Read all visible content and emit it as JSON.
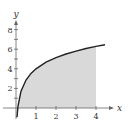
{
  "chart_data": {
    "type": "area",
    "title": "",
    "xlabel": "x",
    "ylabel": "y",
    "xlim": [
      -0.1,
      4.8
    ],
    "ylim": [
      -1.7,
      9.5
    ],
    "grid": false,
    "x_ticks": [
      1,
      2,
      3,
      4
    ],
    "y_ticks": [
      2,
      4,
      6,
      8
    ],
    "y_minor_ticks": [
      1,
      3,
      5,
      7
    ],
    "x_tick_labels": [
      "1",
      "2",
      "3",
      "4"
    ],
    "y_tick_labels": [
      "2",
      "4",
      "6",
      "8"
    ],
    "series": [
      {
        "name": "curve",
        "x": [
          0.05,
          0.1,
          0.25,
          0.5,
          0.75,
          1,
          1.5,
          2,
          2.5,
          3,
          3.5,
          4,
          4.45
        ],
        "values": [
          -0.94,
          0.2,
          1.71,
          2.86,
          3.53,
          4.0,
          4.67,
          5.14,
          5.51,
          5.81,
          6.07,
          6.29,
          6.46
        ]
      }
    ],
    "shaded_region": {
      "from_x": 0.09,
      "to_x": 4,
      "between": "curve and x-axis"
    },
    "colors": {
      "curve": "#222222",
      "shade": "#d9d9d9",
      "axis": "#666666"
    }
  },
  "labels": {
    "x_axis": "x",
    "y_axis": "y",
    "xt1": "1",
    "xt2": "2",
    "xt3": "3",
    "xt4": "4",
    "yt2": "2",
    "yt4": "4",
    "yt6": "6",
    "yt8": "8"
  }
}
